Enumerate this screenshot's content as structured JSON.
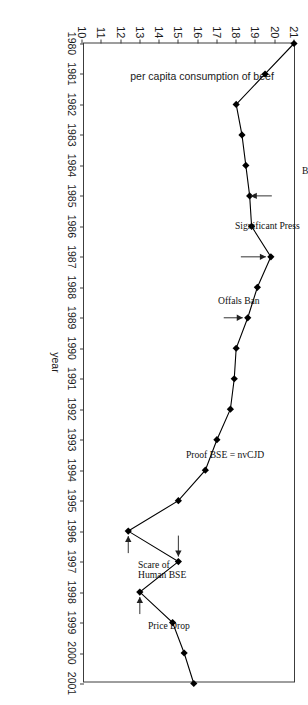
{
  "chart_data": {
    "type": "line",
    "title": "",
    "subtitle": "",
    "xlabel": "year",
    "ylabel": "per capita consumption of beef",
    "orientation": "rotated-90-clockwise",
    "grid": false,
    "legend": "none",
    "marker": "filled-diamond",
    "line_color": "#000000",
    "marker_color": "#000000",
    "frame_color": "#3c3c3c",
    "xlim": [
      1980,
      2001
    ],
    "ylim": [
      10,
      21
    ],
    "yticks": [
      "21",
      "20",
      "19",
      "18",
      "17",
      "16",
      "15",
      "14",
      "13",
      "12",
      "11",
      "10"
    ],
    "xticks": [
      "1980",
      "1981",
      "1982",
      "1983",
      "1984",
      "1985",
      "1986",
      "1987",
      "1988",
      "1989",
      "1990",
      "1991",
      "1992",
      "1993",
      "1994",
      "1995",
      "1996",
      "1997",
      "1998",
      "1999",
      "2000",
      "2001"
    ],
    "x": [
      1980,
      1981,
      1982,
      1983,
      1984,
      1985,
      1986,
      1987,
      1988,
      1989,
      1990,
      1991,
      1992,
      1993,
      1994,
      1995,
      1996,
      1997,
      1998,
      1999,
      2000,
      2001
    ],
    "values": [
      21.0,
      19.5,
      18.0,
      18.3,
      18.5,
      18.7,
      18.8,
      19.8,
      19.1,
      18.6,
      18.0,
      17.9,
      17.7,
      17.0,
      16.4,
      15.0,
      12.4,
      15.0,
      13.0,
      14.7,
      15.3,
      15.8
    ],
    "series": [
      {
        "name": "per capita consumption of beef",
        "values": [
          21.0,
          19.5,
          18.0,
          18.3,
          18.5,
          18.7,
          18.8,
          19.8,
          19.1,
          18.6,
          18.0,
          17.9,
          17.7,
          17.0,
          16.4,
          15.0,
          12.4,
          15.0,
          13.0,
          14.7,
          15.3,
          15.8
        ]
      }
    ],
    "annotations": [
      {
        "text": "BSE Discovered",
        "x": 1985,
        "y": 18.5,
        "arrow": true
      },
      {
        "text": "Significant Press",
        "x": 1987,
        "y": 19.8,
        "arrow": true
      },
      {
        "text": "Offals Ban",
        "x": 1989,
        "y": 18.6,
        "arrow": true
      },
      {
        "text": "Proof BSE = nvCJD",
        "x": 1997,
        "y": 15.0,
        "arrow": true
      },
      {
        "text": "Scare of\nHuman BSE",
        "x": 1996,
        "y": 12.4,
        "arrow": true
      },
      {
        "text": "Price Drop",
        "x": 1998,
        "y": 13.0,
        "arrow": true
      }
    ]
  },
  "annotation_labels": {
    "bse_discovered": "BSE Discovered",
    "significant_press": "Significant Press",
    "offals_ban": "Offals Ban",
    "proof_bse_nvcjd": "Proof BSE = nvCJD",
    "scare_human_bse_line1": "Scare of",
    "scare_human_bse_line2": "Human BSE",
    "price_drop": "Price Drop"
  }
}
